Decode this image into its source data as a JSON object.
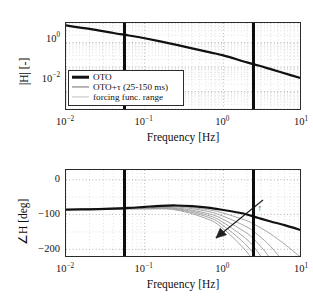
{
  "figure": {
    "kind": "bode-plot",
    "background": "#ffffff"
  },
  "colors": {
    "oto": "#111111",
    "tau_family": "#8c8c8c",
    "forcing_range": "#bdbdbd",
    "marker_bar": "#0d0d0d",
    "grid_major": "#8a8a8a",
    "grid_minor": "#b5b5b5",
    "axis": "#2b2b2b"
  },
  "legend": {
    "position": "lower-left-of-magnitude-panel",
    "entries": [
      {
        "label": "OTO",
        "key": "thick-black-line"
      },
      {
        "label": "OTO+τ (25-150 ms)",
        "key": "thin-gray-line"
      },
      {
        "label": "forcing func. range",
        "key": "light-gray-line"
      }
    ]
  },
  "annotations": [
    {
      "text": "τ ↑",
      "panel": "phase",
      "meaning": "increasing-time-delay"
    }
  ],
  "markers": {
    "label": "forcing function range",
    "frequencies_hz": [
      0.063,
      2.8
    ]
  },
  "chart_data": [
    {
      "type": "line",
      "id": "magnitude",
      "title": "",
      "xlabel": "Frequency [Hz]",
      "ylabel": "|H| [-]",
      "xscale": "log",
      "yscale": "log",
      "xlim": [
        0.01,
        10
      ],
      "ylim": [
        0.0016,
        6.3
      ],
      "xticks": [
        0.01,
        0.1,
        1,
        10
      ],
      "xticklabels": [
        "10−2",
        "10−1",
        "10⁰",
        "10¹"
      ],
      "yticks": [
        1,
        0.01
      ],
      "yticklabels": [
        "10⁰",
        "10−2"
      ],
      "grid": "both",
      "series": [
        {
          "name": "OTO",
          "color": "#111111",
          "width": 2.2,
          "x": [
            0.01,
            0.02,
            0.04,
            0.063,
            0.1,
            0.2,
            0.4,
            0.7,
            1.0,
            2.0,
            2.8,
            4.0,
            7.0,
            10.0
          ],
          "y": [
            5.0,
            3.6,
            2.45,
            1.95,
            1.5,
            0.95,
            0.58,
            0.39,
            0.3,
            0.155,
            0.115,
            0.082,
            0.048,
            0.034
          ]
        },
        {
          "name": "OTO+τ (25-150 ms)",
          "color": "#8c8c8c",
          "width": 1.0,
          "note": "magnitude identical to OTO; delay affects phase only",
          "x": [
            0.01,
            0.02,
            0.04,
            0.063,
            0.1,
            0.2,
            0.4,
            0.7,
            1.0,
            2.0,
            2.8,
            4.0,
            7.0,
            10.0
          ],
          "y": [
            5.0,
            3.6,
            2.45,
            1.95,
            1.5,
            0.95,
            0.58,
            0.39,
            0.3,
            0.155,
            0.115,
            0.082,
            0.048,
            0.034
          ]
        }
      ]
    },
    {
      "type": "line",
      "id": "phase",
      "title": "",
      "xlabel": "Frequency [Hz]",
      "ylabel": "∠H [deg]",
      "xscale": "log",
      "yscale": "linear",
      "xlim": [
        0.01,
        10
      ],
      "ylim": [
        -225,
        28
      ],
      "xticks": [
        0.01,
        0.1,
        1,
        10
      ],
      "xticklabels": [
        "10−2",
        "10−1",
        "10⁰",
        "10¹"
      ],
      "yticks": [
        0,
        -100,
        -200
      ],
      "yticklabels": [
        "0",
        "−100",
        "−200"
      ],
      "grid": "both",
      "series": [
        {
          "name": "OTO",
          "color": "#111111",
          "width": 2.2,
          "x": [
            0.01,
            0.02,
            0.04,
            0.063,
            0.1,
            0.16,
            0.25,
            0.4,
            0.63,
            1.0,
            1.6,
            2.0,
            2.8,
            4.0,
            6.3,
            10.0
          ],
          "y": [
            -86,
            -85,
            -83,
            -81,
            -78,
            -75,
            -74,
            -76,
            -80,
            -87,
            -95,
            -100,
            -110,
            -120,
            -132,
            -146
          ]
        },
        {
          "name": "τ = 25 ms",
          "color": "#9a9a9a",
          "width": 0.9,
          "x": [
            0.01,
            0.1,
            0.25,
            0.63,
            1.0,
            2.0,
            2.8,
            4.0,
            6.3,
            10.0
          ],
          "y": [
            -86,
            -79,
            -76,
            -86,
            -96,
            -118,
            -135,
            -156,
            -189,
            -226
          ]
        },
        {
          "name": "τ = 50 ms",
          "color": "#9a9a9a",
          "width": 0.9,
          "x": [
            0.01,
            0.1,
            0.25,
            0.63,
            1.0,
            2.0,
            2.8,
            4.0,
            6.3,
            10.0
          ],
          "y": [
            -86,
            -80,
            -78,
            -91,
            -105,
            -136,
            -160,
            -192,
            -245,
            -300
          ]
        },
        {
          "name": "τ = 75 ms",
          "color": "#9a9a9a",
          "width": 0.9,
          "x": [
            0.01,
            0.1,
            0.25,
            0.63,
            1.0,
            2.0,
            2.8,
            4.0,
            6.3,
            10.0
          ],
          "y": [
            -86,
            -81,
            -81,
            -97,
            -114,
            -154,
            -185,
            -228,
            -300,
            -375
          ]
        },
        {
          "name": "τ = 100 ms",
          "color": "#9a9a9a",
          "width": 0.9,
          "x": [
            0.01,
            0.1,
            0.25,
            0.63,
            1.0,
            2.0,
            2.8,
            4.0,
            6.3,
            10.0
          ],
          "y": [
            -86,
            -82,
            -83,
            -102,
            -123,
            -172,
            -211,
            -264,
            -355,
            -446
          ]
        },
        {
          "name": "τ = 125 ms",
          "color": "#9a9a9a",
          "width": 0.9,
          "x": [
            0.01,
            0.1,
            0.25,
            0.63,
            1.0,
            2.0,
            2.8,
            4.0,
            6.3,
            10.0
          ],
          "y": [
            -86,
            -83,
            -85,
            -107,
            -132,
            -190,
            -236,
            -300,
            -410,
            -520
          ]
        },
        {
          "name": "τ = 150 ms",
          "color": "#9a9a9a",
          "width": 0.9,
          "x": [
            0.01,
            0.1,
            0.25,
            0.63,
            1.0,
            2.0,
            2.8,
            4.0,
            6.3,
            10.0
          ],
          "y": [
            -86,
            -84,
            -87,
            -113,
            -141,
            -208,
            -261,
            -336,
            -465,
            -592
          ]
        }
      ]
    }
  ]
}
